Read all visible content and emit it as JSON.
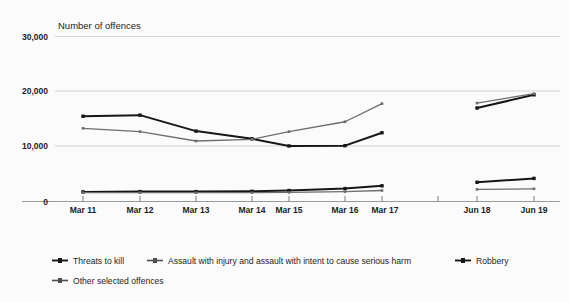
{
  "chart_data": {
    "type": "line",
    "title": "Number of offences",
    "xlabel": "",
    "ylabel": "",
    "ylim": [
      0,
      30000
    ],
    "yticks": [
      0,
      10000,
      20000,
      30000
    ],
    "ytick_labels": [
      "0",
      "10,000",
      "20,000",
      "30,000"
    ],
    "grid": true,
    "legend_position": "bottom",
    "categories": [
      "Mar 11",
      "Mar 12",
      "Mar 13",
      "Mar 14",
      "Mar 15",
      "Mar 16",
      "Mar 17",
      "",
      "Jun 18",
      "Jun 19"
    ],
    "note": "Gap in series between Mar 17 and Jun 18; unlabelled tick between them.",
    "series": [
      {
        "name": "Threats to kill",
        "color": "#161616",
        "style": "dark-thick",
        "values": [
          15500,
          15700,
          12800,
          11400,
          10100,
          10150,
          12500,
          null,
          17000,
          19400
        ]
      },
      {
        "name": "Assault with injury and assault with intent to cause serious harm",
        "color": "#6d6d6d",
        "style": "gray-thin",
        "values": [
          13300,
          12700,
          11000,
          11300,
          12700,
          14500,
          17800,
          null,
          17900,
          19600
        ]
      },
      {
        "name": "Robbery",
        "color": "#161616",
        "style": "dark-thick",
        "values": [
          1750,
          1800,
          1800,
          1850,
          2000,
          2350,
          2850,
          null,
          3500,
          4200
        ]
      },
      {
        "name": "Other selected offences",
        "color": "#6d6d6d",
        "style": "gray-thin",
        "values": [
          1600,
          1600,
          1600,
          1600,
          1650,
          1800,
          2000,
          null,
          2200,
          2300
        ]
      }
    ]
  },
  "chart": {
    "title": "Number of offences",
    "ytick_labels": [
      "30,000",
      "20,000",
      "10,000",
      "0"
    ],
    "xtick_labels": [
      "Mar 11",
      "Mar 12",
      "Mar 13",
      "Mar 14",
      "Mar 15",
      "Mar 16",
      "Mar 17",
      "Jun 18",
      "Jun 19"
    ]
  },
  "legend": {
    "items": [
      {
        "label": "Threats to kill",
        "color": "#161616"
      },
      {
        "label": "Assault with injury and assault with intent to cause serious harm",
        "color": "#6d6d6d"
      },
      {
        "label": "Robbery",
        "color": "#161616"
      },
      {
        "label": "Other selected offences",
        "color": "#6d6d6d"
      }
    ]
  }
}
